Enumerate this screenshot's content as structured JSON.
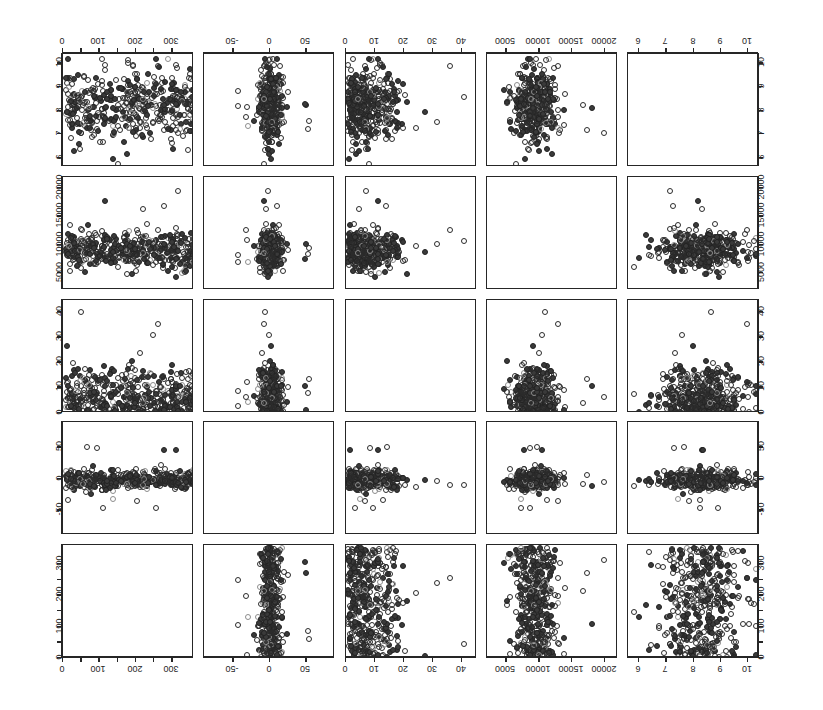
{
  "figure": {
    "type": "scatter-plot-matrix",
    "variables": [
      "Gal Long (degrees)",
      "Gal Lat (degrees)",
      "Diameter (pc)",
      "GC (pc)",
      "Age (log t)"
    ],
    "n_rows": 5,
    "n_cols": 5,
    "orientation_note": "scanned page, tick labels printed rotated 180 degrees",
    "marker": "open-circle"
  },
  "diagonal": [
    {
      "line1": "Age",
      "line2": "(log t)"
    },
    {
      "line1": "GC",
      "line2": "(pc)"
    },
    {
      "line1": "Diameter",
      "line2": "(pc)"
    },
    {
      "line1": "Gal Lat",
      "line2": "(degrees)"
    },
    {
      "line1": "Gal Long",
      "line2": "(degrees)"
    }
  ],
  "axes": {
    "gal_long": {
      "label": "Gal Long (degrees)",
      "ticks": [
        0,
        50,
        100,
        150,
        200,
        250,
        300
      ],
      "labeled": [
        "0",
        "100",
        "200",
        "300"
      ],
      "min": 0,
      "max": 360
    },
    "gal_lat": {
      "label": "Gal Lat (degrees)",
      "ticks": [
        -50,
        0,
        50
      ],
      "labeled": [
        "-50",
        "0",
        "50"
      ],
      "min": -90,
      "max": 90
    },
    "diameter": {
      "label": "Diameter (pc)",
      "ticks": [
        0,
        10,
        20,
        30,
        40
      ],
      "labeled": [
        "0",
        "10",
        "20",
        "30",
        "40"
      ],
      "min": 0,
      "max": 45
    },
    "gc": {
      "label": "GC (pc)",
      "ticks": [
        5000,
        10000,
        15000,
        20000
      ],
      "labeled": [
        "5000",
        "10000",
        "15000",
        "20000"
      ],
      "min": 2000,
      "max": 22000
    },
    "age": {
      "label": "Age (log t)",
      "ticks": [
        6,
        7,
        8,
        9,
        10
      ],
      "labeled": [
        "6",
        "7",
        "8",
        "9",
        "10"
      ],
      "min": 5.6,
      "max": 10.4
    }
  },
  "chart_data": {
    "type": "scatter",
    "title": "",
    "xlabel": "",
    "ylabel": "",
    "grid": false,
    "legend": "none",
    "variables": [
      {
        "key": "gal_long",
        "name": "Gal Long",
        "unit": "degrees",
        "min": 0,
        "max": 360,
        "tick_labels": [
          "0",
          "100",
          "200",
          "300"
        ]
      },
      {
        "key": "gal_lat",
        "name": "Gal Lat",
        "unit": "degrees",
        "min": -90,
        "max": 90,
        "tick_labels": [
          "-50",
          "0",
          "50"
        ]
      },
      {
        "key": "diameter",
        "name": "Diameter",
        "unit": "pc",
        "min": 0,
        "max": 45,
        "tick_labels": [
          "0",
          "10",
          "20",
          "30",
          "40"
        ]
      },
      {
        "key": "gc",
        "name": "GC",
        "unit": "pc",
        "min": 2000,
        "max": 22000,
        "tick_labels": [
          "5000",
          "10000",
          "15000",
          "20000"
        ]
      },
      {
        "key": "age",
        "name": "Age",
        "unit": "log t",
        "min": 5.6,
        "max": 10.4,
        "tick_labels": [
          "6",
          "7",
          "8",
          "9",
          "10"
        ]
      }
    ],
    "row_order": [
      "age",
      "gc",
      "diameter",
      "gal_lat",
      "gal_long"
    ],
    "col_order": [
      "gal_long",
      "gal_lat",
      "diameter",
      "gc",
      "age"
    ],
    "n_points": 420,
    "distributions": {
      "gal_long": {
        "shape": "broad-uniform",
        "center": 180,
        "spread": 105
      },
      "gal_lat": {
        "shape": "narrow-peak",
        "center": 0,
        "spread": 7
      },
      "diameter": {
        "shape": "right-skew",
        "center": 6,
        "spread": 6
      },
      "gc": {
        "shape": "narrow-peak",
        "center": 9000,
        "spread": 1600
      },
      "age": {
        "shape": "broad-peak",
        "center": 8.3,
        "spread": 0.85
      }
    }
  }
}
